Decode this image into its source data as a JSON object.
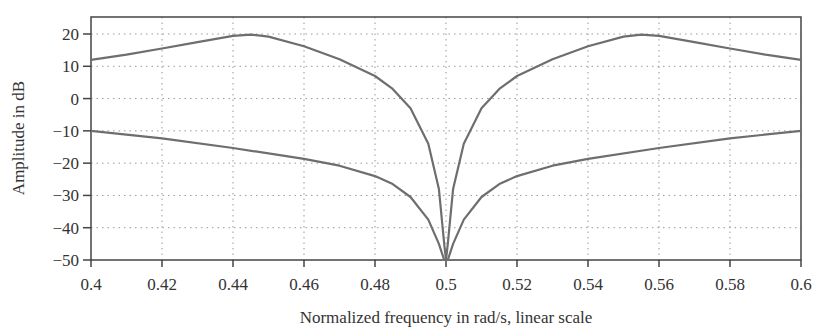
{
  "chart_data": {
    "type": "line",
    "title": "",
    "xlabel": "Normalized frequency in rad/s, linear scale",
    "ylabel": "Amplitude in dB",
    "xlim": [
      0.4,
      0.6
    ],
    "ylim": [
      -50,
      25
    ],
    "grid": true,
    "legend": null,
    "x_ticks": [
      "0.4",
      "0.42",
      "0.44",
      "0.46",
      "0.48",
      "0.5",
      "0.52",
      "0.54",
      "0.56",
      "0.58",
      "0.6"
    ],
    "y_ticks": [
      "20",
      "10",
      "0",
      "-10",
      "-20",
      "-30",
      "-40",
      "-50"
    ],
    "series": [
      {
        "name": "upper curve",
        "x": [
          0.4,
          0.41,
          0.42,
          0.43,
          0.44,
          0.445,
          0.45,
          0.46,
          0.47,
          0.48,
          0.485,
          0.49,
          0.495,
          0.498,
          0.4995,
          0.5,
          0.5005,
          0.502,
          0.505,
          0.51,
          0.515,
          0.52,
          0.53,
          0.54,
          0.55,
          0.555,
          0.56,
          0.57,
          0.58,
          0.59,
          0.6
        ],
        "values": [
          12,
          13.6,
          15.5,
          17.5,
          19.4,
          19.8,
          19.2,
          16.2,
          12.2,
          7,
          3,
          -3,
          -14,
          -28,
          -45,
          -50,
          -45,
          -28,
          -14,
          -3,
          3,
          7,
          12.2,
          16.2,
          19.2,
          19.8,
          19.4,
          17.5,
          15.5,
          13.6,
          12
        ]
      },
      {
        "name": "lower curve",
        "x": [
          0.4,
          0.42,
          0.44,
          0.46,
          0.47,
          0.48,
          0.485,
          0.49,
          0.495,
          0.498,
          0.4995,
          0.5,
          0.5005,
          0.502,
          0.505,
          0.51,
          0.515,
          0.52,
          0.53,
          0.54,
          0.56,
          0.58,
          0.6
        ],
        "values": [
          -10,
          -12.3,
          -15.3,
          -18.7,
          -20.8,
          -24,
          -26.5,
          -30.5,
          -37.5,
          -45,
          -50,
          -50,
          -50,
          -45,
          -37.5,
          -30.5,
          -26.5,
          -24,
          -20.8,
          -18.7,
          -15.3,
          -12.3,
          -10
        ]
      }
    ]
  }
}
